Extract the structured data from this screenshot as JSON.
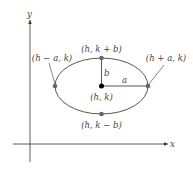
{
  "diagram": {
    "axes": {
      "x_label": "x",
      "y_label": "y"
    },
    "center_label": "(h, k)",
    "top_label": "(h, k + b)",
    "bottom_label": "(h, k − b)",
    "left_label": "(h − a, k)",
    "right_label": "(h + a, k)",
    "semi_major_label": "a",
    "semi_minor_label": "b",
    "colors": {
      "curve": "#555555",
      "point": "#666666",
      "center": "#000000",
      "axis": "#333333"
    }
  }
}
